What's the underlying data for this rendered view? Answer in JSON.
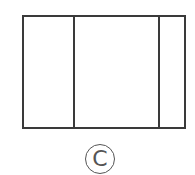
{
  "diagram": {
    "shape": "rectangle divided into three vertical panels",
    "panels": 3,
    "label": "C"
  },
  "colors": {
    "stroke": "#3a3a3a",
    "label": "#555555"
  }
}
